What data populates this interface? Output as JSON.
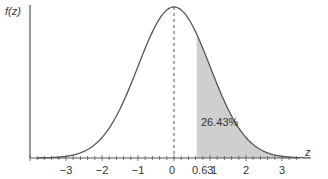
{
  "chart_data": {
    "type": "area",
    "title": "",
    "xlabel": "z",
    "ylabel": "f(z)",
    "distribution": "standard normal",
    "x_range": [
      -3.9,
      3.9
    ],
    "xticks": [
      -3,
      -2,
      -1,
      0,
      0.63,
      1,
      2,
      3
    ],
    "xtick_labels": [
      "−3",
      "−2",
      "−1",
      "0",
      "0.63",
      "1",
      "2",
      "3"
    ],
    "minor_tick_step": 0.2,
    "shaded_region": {
      "from": 0.63,
      "to": 3.9,
      "label": "26.43%",
      "area": 0.2643
    },
    "mean_line": {
      "x": 0,
      "style": "dashed"
    },
    "peak": {
      "x": 0,
      "y": 0.3989
    },
    "grid": false,
    "legend": "none"
  },
  "labels": {
    "ylabel": "f(z)",
    "xlabel": "z",
    "area_label": "26.43%"
  },
  "colors": {
    "curve": "#555555",
    "shade": "#cfcfcf",
    "axis": "#555555",
    "text": "#333333"
  },
  "layout": {
    "origin_px_x": 174,
    "px_per_unit": 36,
    "baseline_px_y": 158,
    "peak_px_y": 7,
    "yaxis_px_x": 30
  }
}
